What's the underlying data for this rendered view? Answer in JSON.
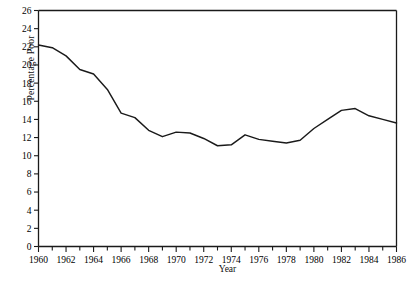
{
  "chart_data": {
    "type": "line",
    "title": "",
    "xlabel": "Year",
    "ylabel": "Percentage Poor",
    "xlim": [
      1960,
      1986
    ],
    "ylim": [
      0,
      26
    ],
    "ytick_step": 2,
    "xtick_step": 2,
    "xminor_step": 1,
    "grid": false,
    "legend": false,
    "line_color": "#1a1a1a",
    "x": [
      1960,
      1961,
      1962,
      1963,
      1964,
      1965,
      1966,
      1967,
      1968,
      1969,
      1970,
      1971,
      1972,
      1973,
      1974,
      1975,
      1976,
      1977,
      1978,
      1979,
      1980,
      1981,
      1982,
      1983,
      1984,
      1985,
      1986
    ],
    "values": [
      22.2,
      21.9,
      21.0,
      19.5,
      19.0,
      17.3,
      14.7,
      14.2,
      12.8,
      12.1,
      12.6,
      12.5,
      11.9,
      11.1,
      11.2,
      12.3,
      11.8,
      11.6,
      11.4,
      11.7,
      13.0,
      14.0,
      15.0,
      15.2,
      14.4,
      14.0,
      13.6
    ],
    "ytick_labels": [
      "0",
      "2",
      "4",
      "6",
      "8",
      "10",
      "12",
      "14",
      "16",
      "18",
      "20",
      "22",
      "24",
      "26"
    ],
    "xtick_labels": [
      "1960",
      "1962",
      "1964",
      "1966",
      "1968",
      "1970",
      "1972",
      "1974",
      "1976",
      "1978",
      "1980",
      "1982",
      "1984",
      "1986"
    ]
  },
  "axis": {
    "y_title": "Percentage Poor",
    "x_title": "Year"
  }
}
